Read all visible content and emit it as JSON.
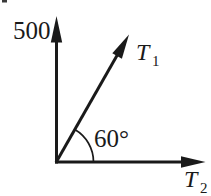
{
  "diagram": {
    "background_color": "#ffffff",
    "ink_color": "#1a1a1a",
    "labels": {
      "axis_value": "500",
      "vector1_base": "T",
      "vector1_sub": "1",
      "vector2_base": "T",
      "vector2_sub": "2",
      "angle": "60°"
    },
    "angle_degrees": 60
  }
}
